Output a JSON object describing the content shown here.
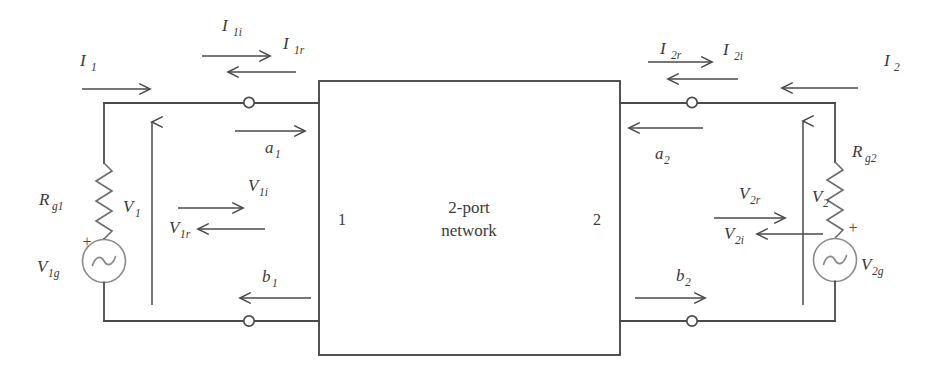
{
  "figure": {
    "type": "circuit-schematic",
    "background_color": "#ffffff",
    "line_color": "#4a4a4a"
  },
  "network_box": {
    "line1": "2-port",
    "line2": "network",
    "port1_number": "1",
    "port2_number": "2"
  },
  "left_side": {
    "source_resistor": {
      "base": "R",
      "sub": "g1"
    },
    "source_generator": {
      "base": "V",
      "sub": "1g"
    },
    "source_polarity": "+",
    "port_voltage": {
      "base": "V",
      "sub": "1"
    },
    "current_total": {
      "base": "I",
      "sub": "1"
    },
    "current_incident": {
      "base": "I",
      "sub": "1i"
    },
    "current_reflected": {
      "base": "I",
      "sub": "1r"
    },
    "voltage_incident": {
      "base": "V",
      "sub": "1i"
    },
    "voltage_reflected": {
      "base": "V",
      "sub": "1r"
    },
    "wave_incident": {
      "base": "a",
      "sub": "1"
    },
    "wave_reflected": {
      "base": "b",
      "sub": "1"
    }
  },
  "right_side": {
    "source_resistor": {
      "base": "R",
      "sub": "g2"
    },
    "source_generator": {
      "base": "V",
      "sub": "2g"
    },
    "source_polarity": "+",
    "port_voltage": {
      "base": "V",
      "sub": "2"
    },
    "current_total": {
      "base": "I",
      "sub": "2"
    },
    "current_incident": {
      "base": "I",
      "sub": "2i"
    },
    "current_reflected": {
      "base": "I",
      "sub": "2r"
    },
    "voltage_incident": {
      "base": "V",
      "sub": "2i"
    },
    "voltage_reflected": {
      "base": "V",
      "sub": "2r"
    },
    "wave_incident": {
      "base": "a",
      "sub": "2"
    },
    "wave_reflected": {
      "base": "b",
      "sub": "2"
    }
  }
}
